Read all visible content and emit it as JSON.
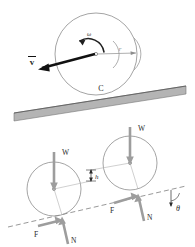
{
  "figure": {
    "colors": {
      "ink": "#2b2b2b",
      "gray_line": "#9a9a9a",
      "light_gray": "#b8b8b8",
      "force_gray": "#9d9d9d",
      "ground_fill": "#b4b4b4",
      "ground_edge": "#6e6e6e",
      "background": "#ffffff"
    },
    "top_panel": {
      "name": "rolling-wheel-kinematics",
      "wheel": {
        "center_label": "o",
        "radius_label": "r",
        "angular_velocity_label": "ω",
        "velocity_label": "v",
        "velocity_overbar": true,
        "contact_point_label": "C"
      },
      "ground": {
        "label": "inclined-surface"
      }
    },
    "bottom_panel": {
      "name": "free-body-diagram",
      "wheels": [
        {
          "position": "lower-left",
          "center_label": "o",
          "weight_label": "W",
          "friction_label": "F",
          "normal_label": "N"
        },
        {
          "position": "upper-right",
          "center_label": "o",
          "weight_label": "W",
          "friction_label": "F",
          "normal_label": "N"
        }
      ],
      "height_label": "h",
      "angle_label": "θ",
      "incline_line": "dashed"
    }
  }
}
